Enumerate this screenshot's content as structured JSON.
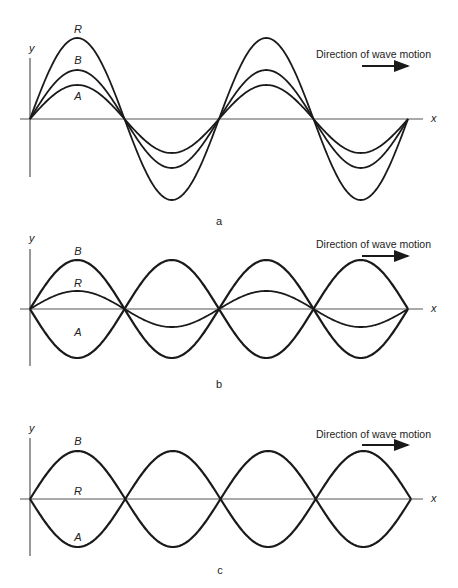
{
  "figure": {
    "panels": [
      {
        "id": "a",
        "caption": "a",
        "axis_y_label": "y",
        "axis_x_label": "x",
        "direction_label": "Direction of wave motion",
        "curve_labels": {
          "top": "R",
          "middle": "B",
          "bottom": "A"
        },
        "geometry": {
          "x0": 30,
          "x_end": 408,
          "axis_y": 119,
          "axis_left": 20,
          "axis_right": 423,
          "yaxis_top": 58,
          "yaxis_bottom": 177,
          "half_period": 94.5
        },
        "curves": [
          {
            "name": "R",
            "kind": "sin",
            "amp": 81
          },
          {
            "name": "B",
            "kind": "sin",
            "amp": 49
          },
          {
            "name": "A",
            "kind": "sin",
            "amp": 34
          }
        ],
        "label_pos": {
          "y_lbl": [
            29,
            52
          ],
          "x_lbl": [
            431,
            122
          ],
          "top": [
            78,
            33
          ],
          "middle": [
            78,
            64
          ],
          "bottom": [
            78,
            100
          ],
          "dir": [
            316,
            58
          ],
          "arrow": [
            362,
            408,
            66
          ],
          "cap": [
            219,
            225
          ]
        }
      },
      {
        "id": "b",
        "caption": "b",
        "axis_y_label": "y",
        "axis_x_label": "x",
        "direction_label": "Direction of wave motion",
        "curve_labels": {
          "top": "B",
          "middle": "R",
          "bottom": "A"
        },
        "geometry": {
          "x0": 30,
          "x_end": 408,
          "axis_y": 309,
          "axis_left": 20,
          "axis_right": 423,
          "yaxis_top": 249,
          "yaxis_bottom": 366,
          "half_period": 94.5
        },
        "curves": [
          {
            "name": "B",
            "kind": "sin",
            "amp": 49
          },
          {
            "name": "A",
            "kind": "sin",
            "amp": -49
          },
          {
            "name": "R",
            "kind": "sin",
            "amp": 18
          }
        ],
        "label_pos": {
          "y_lbl": [
            29,
            242
          ],
          "x_lbl": [
            431,
            312
          ],
          "top": [
            78,
            255
          ],
          "middle": [
            78,
            287
          ],
          "bottom": [
            78,
            336
          ],
          "dir": [
            316,
            248
          ],
          "arrow": [
            362,
            408,
            256
          ],
          "cap": [
            219,
            388
          ]
        }
      },
      {
        "id": "c",
        "caption": "c",
        "axis_y_label": "y",
        "axis_x_label": "x",
        "direction_label": "Direction of wave motion",
        "curve_labels": {
          "top": "B",
          "middle": "R",
          "bottom": "A"
        },
        "geometry": {
          "x0": 30,
          "x_end": 411,
          "axis_y": 499,
          "axis_left": 20,
          "axis_right": 423,
          "yaxis_top": 438,
          "yaxis_bottom": 556,
          "half_period": 95.25
        },
        "curves": [
          {
            "name": "B",
            "kind": "sin",
            "amp": 48
          },
          {
            "name": "A",
            "kind": "sin",
            "amp": -48
          }
        ],
        "label_pos": {
          "y_lbl": [
            29,
            432
          ],
          "x_lbl": [
            431,
            502
          ],
          "top": [
            78,
            445
          ],
          "middle": [
            78,
            495
          ],
          "bottom": [
            78,
            541
          ],
          "dir": [
            316,
            438
          ],
          "arrow": [
            362,
            408,
            445
          ],
          "cap": [
            220,
            574
          ]
        }
      }
    ]
  }
}
